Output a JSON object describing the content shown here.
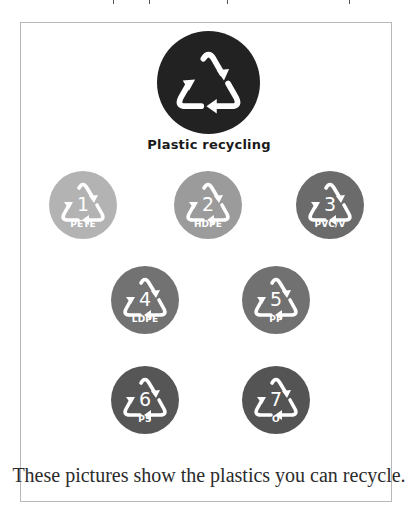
{
  "hero": {
    "label": "Plastic recycling",
    "icon": "recycle-triangle-icon",
    "color": "#222222"
  },
  "codes": [
    {
      "number": "1",
      "abbr": "PETE",
      "color": "#b3b3b3"
    },
    {
      "number": "2",
      "abbr": "HDPE",
      "color": "#9b9b9b"
    },
    {
      "number": "3",
      "abbr": "PVC/V",
      "color": "#6b6b6b"
    },
    {
      "number": "4",
      "abbr": "LDPE",
      "color": "#727272"
    },
    {
      "number": "5",
      "abbr": "PP",
      "color": "#717171"
    },
    {
      "number": "6",
      "abbr": "PS",
      "color": "#565656"
    },
    {
      "number": "7",
      "abbr": "O",
      "color": "#545454"
    }
  ],
  "caption": "These pictures show the plastics you can recycle."
}
